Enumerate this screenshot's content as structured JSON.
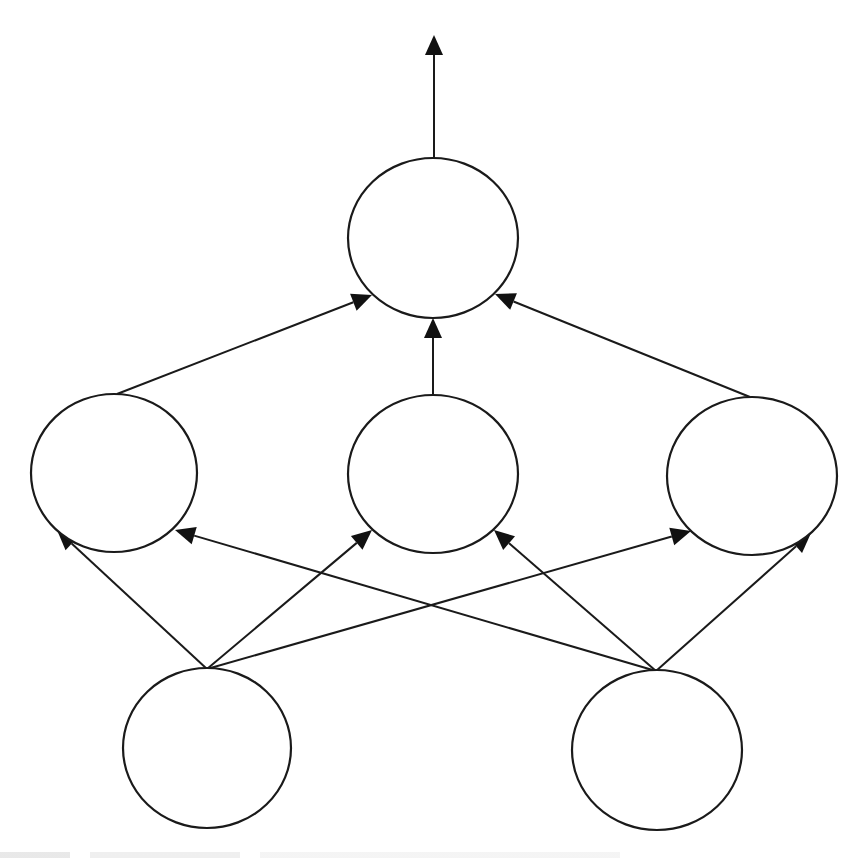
{
  "diagram": {
    "type": "feed-forward neural network",
    "colors": {
      "stroke": "#1a1a1a",
      "fill": "#ffffff",
      "background": "#ffffff"
    },
    "layers": [
      {
        "name": "input",
        "nodes": [
          {
            "id": "in1",
            "cx": 207,
            "cy": 748,
            "rx": 84,
            "ry": 80
          },
          {
            "id": "in2",
            "cx": 657,
            "cy": 750,
            "rx": 85,
            "ry": 80
          }
        ]
      },
      {
        "name": "hidden",
        "nodes": [
          {
            "id": "h1",
            "cx": 114,
            "cy": 473,
            "rx": 83,
            "ry": 79
          },
          {
            "id": "h2",
            "cx": 433,
            "cy": 474,
            "rx": 85,
            "ry": 79
          },
          {
            "id": "h3",
            "cx": 752,
            "cy": 476,
            "rx": 85,
            "ry": 79
          }
        ]
      },
      {
        "name": "output",
        "nodes": [
          {
            "id": "out",
            "cx": 433,
            "cy": 238,
            "rx": 85,
            "ry": 80
          }
        ]
      }
    ],
    "edges": [
      {
        "from": "in1",
        "to": "h1",
        "x1": 207,
        "y1": 669,
        "x2": 57,
        "y2": 530
      },
      {
        "from": "in1",
        "to": "h2",
        "x1": 207,
        "y1": 669,
        "x2": 372,
        "y2": 530
      },
      {
        "from": "in1",
        "to": "h3",
        "x1": 207,
        "y1": 669,
        "x2": 691,
        "y2": 531
      },
      {
        "from": "in2",
        "to": "h1",
        "x1": 656,
        "y1": 671,
        "x2": 175,
        "y2": 530
      },
      {
        "from": "in2",
        "to": "h2",
        "x1": 656,
        "y1": 671,
        "x2": 494,
        "y2": 530
      },
      {
        "from": "in2",
        "to": "h3",
        "x1": 656,
        "y1": 671,
        "x2": 811,
        "y2": 533
      },
      {
        "from": "h1",
        "to": "out",
        "x1": 117,
        "y1": 394,
        "x2": 372,
        "y2": 295
      },
      {
        "from": "h2",
        "to": "out",
        "x1": 433,
        "y1": 395,
        "x2": 433,
        "y2": 318
      },
      {
        "from": "h3",
        "to": "out",
        "x1": 750,
        "y1": 397,
        "x2": 495,
        "y2": 294
      },
      {
        "from": "out",
        "to": "output-signal",
        "x1": 434,
        "y1": 159,
        "x2": 434,
        "y2": 35
      }
    ]
  }
}
